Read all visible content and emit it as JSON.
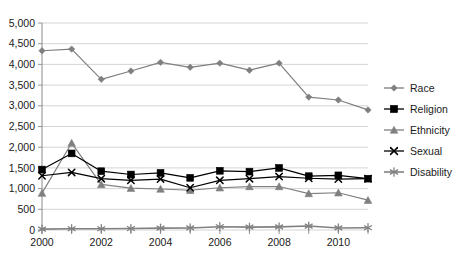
{
  "chart_data": {
    "type": "line",
    "title": "",
    "xlabel": "",
    "ylabel": "",
    "x": [
      2000,
      2001,
      2002,
      2003,
      2004,
      2005,
      2006,
      2007,
      2008,
      2009,
      2010,
      2011
    ],
    "xtick_labels": [
      "2000",
      "",
      "2002",
      "",
      "2004",
      "",
      "2006",
      "",
      "2008",
      "",
      "2010",
      ""
    ],
    "ytick_labels": [
      "0",
      "500",
      "1,000",
      "1,500",
      "2,000",
      "2,500",
      "3,000",
      "3,500",
      "4,000",
      "4,500",
      "5,000"
    ],
    "ylim": [
      0,
      5000
    ],
    "ytick_step": 500,
    "xlim": [
      2000,
      2011
    ],
    "grid": "horizontal",
    "legend_position": "right",
    "series": [
      {
        "name": "Race",
        "marker": "diamond",
        "color": "#7f7f7f",
        "values": [
          4330,
          4370,
          3640,
          3840,
          4050,
          3930,
          4030,
          3860,
          4030,
          3210,
          3140,
          2900
        ]
      },
      {
        "name": "Religion",
        "marker": "square",
        "color": "#000000",
        "values": [
          1460,
          1850,
          1420,
          1340,
          1380,
          1260,
          1430,
          1410,
          1500,
          1300,
          1320,
          1240
        ]
      },
      {
        "name": "Ethnicity",
        "marker": "triangle",
        "color": "#808080",
        "values": [
          890,
          2100,
          1100,
          1010,
          990,
          960,
          1020,
          1050,
          1050,
          880,
          900,
          720
        ]
      },
      {
        "name": "Sexual",
        "marker": "x",
        "color": "#000000",
        "values": [
          1310,
          1390,
          1240,
          1200,
          1230,
          1020,
          1200,
          1240,
          1290,
          1250,
          1230,
          1240
        ]
      },
      {
        "name": "Disability",
        "marker": "asterisk",
        "color": "#808080",
        "values": [
          20,
          30,
          30,
          35,
          45,
          50,
          80,
          70,
          75,
          95,
          50,
          55
        ]
      }
    ]
  },
  "caption": {
    "text": ""
  }
}
